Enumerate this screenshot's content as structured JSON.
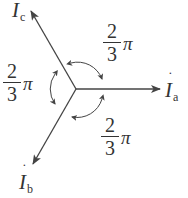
{
  "diagram": {
    "type": "three-phase phasor diagram",
    "center": {
      "x": 76,
      "y": 89
    },
    "phasors": [
      {
        "id": "a",
        "symbol": "I",
        "subscript": "a",
        "angle_deg": 0
      },
      {
        "id": "b",
        "symbol": "I",
        "subscript": "b",
        "angle_deg": -120
      },
      {
        "id": "c",
        "symbol": "I",
        "subscript": "c",
        "angle_deg": 120
      }
    ],
    "angles": [
      {
        "between": "a-c",
        "numerator": "2",
        "denominator": "3",
        "unit": "π"
      },
      {
        "between": "c-b",
        "numerator": "2",
        "denominator": "3",
        "unit": "π"
      },
      {
        "between": "b-a",
        "numerator": "2",
        "denominator": "3",
        "unit": "π"
      }
    ],
    "colors": {
      "line": "#444444",
      "text": "#333333",
      "background": "#ffffff"
    }
  }
}
